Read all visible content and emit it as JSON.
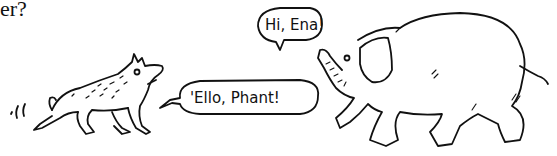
{
  "page": {
    "top_text_fragment": "er?"
  },
  "illustration": {
    "style": "black-and-white pen sketch",
    "characters": [
      {
        "name": "hyena",
        "speech": "'Ello, Phant!",
        "icon": "hyena-icon"
      },
      {
        "name": "elephant",
        "speech": "Hi, Ena!",
        "icon": "elephant-icon"
      }
    ],
    "colors": {
      "ink": "#111111",
      "background": "#ffffff"
    }
  }
}
